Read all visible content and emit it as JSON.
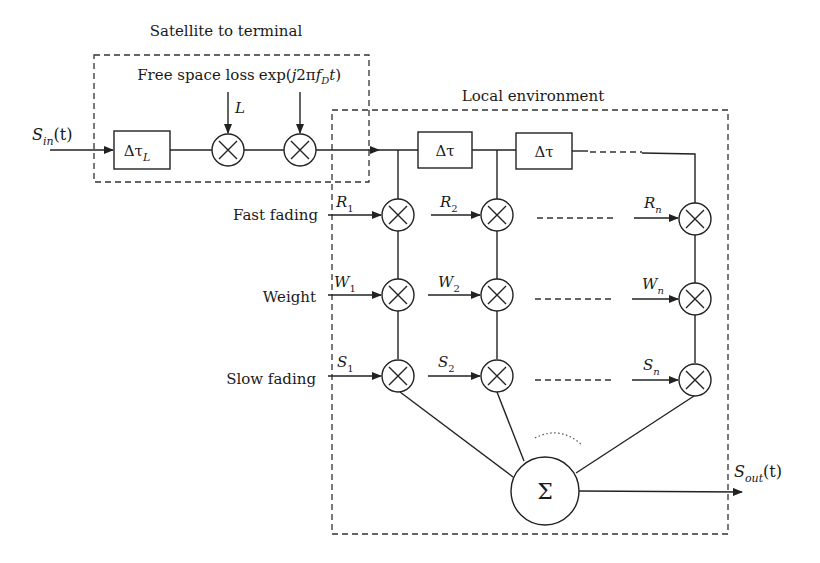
{
  "diagram": {
    "groups": {
      "satellite": {
        "title": "Satellite to terminal"
      },
      "local": {
        "title": "Local environment"
      }
    },
    "input": {
      "label_main": "S",
      "label_sub": "in",
      "label_tail": "(t)"
    },
    "output": {
      "label_main": "S",
      "label_sub": "out",
      "label_tail": "(t)"
    },
    "satellite_chain": {
      "delay_block": {
        "main": "Δτ",
        "sub": "L"
      },
      "free_space_loss": {
        "caption": "Free space loss",
        "input": "L"
      },
      "doppler": {
        "caption_pre": "exp(",
        "caption_j": "j",
        "caption_mid": "2π",
        "caption_f": "f",
        "caption_sub": "D",
        "caption_t": "t",
        "caption_post": ")"
      }
    },
    "tap_delays": [
      {
        "label": "Δτ"
      },
      {
        "label": "Δτ"
      }
    ],
    "row_labels": {
      "fast": "Fast fading",
      "weight": "Weight",
      "slow": "Slow fading"
    },
    "taps": [
      {
        "r_main": "R",
        "r_sub": "1",
        "w_main": "W",
        "w_sub": "1",
        "s_main": "S",
        "s_sub": "1"
      },
      {
        "r_main": "R",
        "r_sub": "2",
        "w_main": "W",
        "w_sub": "2",
        "s_main": "S",
        "s_sub": "2"
      },
      {
        "r_main": "R",
        "r_sub": "n",
        "w_main": "W",
        "w_sub": "n",
        "s_main": "S",
        "s_sub": "n"
      }
    ],
    "multiplier_symbol": "×",
    "summer": {
      "symbol": "Σ"
    }
  }
}
